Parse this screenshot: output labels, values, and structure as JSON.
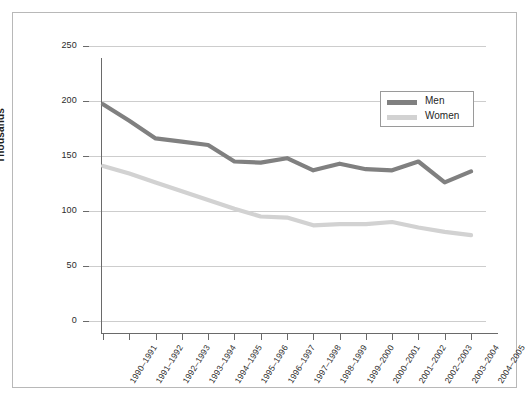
{
  "chart_data": {
    "type": "line",
    "title": "",
    "xlabel": "",
    "ylabel": "Thousands",
    "ylim": [
      0,
      250
    ],
    "yticks": [
      0,
      50,
      100,
      150,
      200,
      250
    ],
    "grid": true,
    "legend_position": "top-right",
    "categories": [
      "1990–1991",
      "1991–1992",
      "1992–1993",
      "1993–1994",
      "1994–1995",
      "1995–1996",
      "1996–1997",
      "1997–1998",
      "1998–1999",
      "1999–2000",
      "2000–2001",
      "2001–2002",
      "2002–2003",
      "2003–2004",
      "2004–2005"
    ],
    "series": [
      {
        "name": "Men",
        "color": "#808080",
        "values": [
          197,
          182,
          166,
          163,
          160,
          145,
          144,
          148,
          137,
          143,
          138,
          137,
          145,
          126,
          136
        ]
      },
      {
        "name": "Women",
        "color": "#d2d2d2",
        "values": [
          141,
          134,
          126,
          118,
          110,
          102,
          95,
          94,
          87,
          88,
          88,
          90,
          85,
          81,
          78
        ]
      }
    ]
  },
  "axis": {
    "y_title": "Thousands",
    "y_tick_labels": [
      "0",
      "50",
      "100",
      "150",
      "200",
      "250"
    ]
  },
  "legend": {
    "items": [
      {
        "label": "Men",
        "color": "#808080"
      },
      {
        "label": "Women",
        "color": "#d2d2d2"
      }
    ]
  },
  "colors": {
    "men_line": "#808080",
    "women_line": "#d2d2d2",
    "gridline": "#cdcdcd",
    "axis": "#6a6a6a",
    "frame_border": "#b8b8b8",
    "background": "#ffffff",
    "text": "#1f1f1f"
  }
}
